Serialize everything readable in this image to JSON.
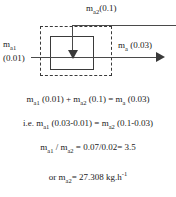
{
  "diagram": {
    "labels": {
      "inlet_top": "m<sub>a2</sub>(0.1)",
      "inlet_left_line1": "m<sub>a1</sub>",
      "inlet_left_line2": "(0.01)",
      "outlet_right": "m<sub>a</sub> (0.03)"
    },
    "icons": {
      "control_volume": "dashed-boundary-box",
      "unit": "solid-process-box",
      "flow_in_left": "right-arrow-icon",
      "flow_in_top": "down-arrow-icon",
      "flow_out_right": "right-arrow-icon"
    },
    "values": {
      "m_a1": "0.01",
      "m_a2": "0.1",
      "m_a": "0.03"
    },
    "colors": {
      "line": "#4a4a4a",
      "boundary": "#3a3a3a",
      "text": "#1a1a1a",
      "background": "#ffffff"
    }
  },
  "equations": [
    {
      "id": "mass-balance",
      "html": "m<sub>a1</sub> (0.01) + m<sub>a2</sub> (0.1) = m<sub>a</sub> (0.03)"
    },
    {
      "id": "rearranged-balance",
      "html": "i.e. m<sub>a1</sub> (0.03-0.01) = m<sub>a2</sub> (0.1-0.03)"
    },
    {
      "id": "ratio",
      "html": "m<sub>a1</sub> / m<sub>a2</sub> = 0.07/0.02= 3.5"
    },
    {
      "id": "result",
      "html": "or m<sub>a2</sub>= 27.308 kg.h<sup>-1</sup>"
    }
  ]
}
